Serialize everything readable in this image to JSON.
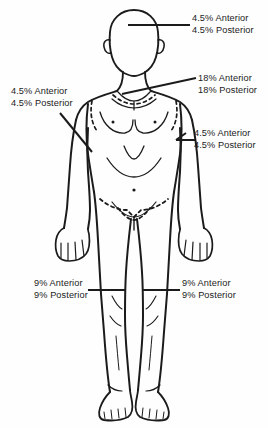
{
  "diagram": {
    "stroke_color": "#1b1b1b",
    "background_color": "#fefefe",
    "text_color": "#1b1b1b"
  },
  "callouts": [
    {
      "id": "head",
      "region": "head",
      "anterior": "4.5% Anterior",
      "posterior": "4.5% Posterior",
      "side": "right"
    },
    {
      "id": "trunk",
      "region": "trunk",
      "anterior": "18% Anterior",
      "posterior": "18% Posterior",
      "side": "right"
    },
    {
      "id": "arm-right",
      "region": "arm",
      "anterior": "4.5% Anterior",
      "posterior": "4.5% Posterior",
      "side": "right"
    },
    {
      "id": "arm-left",
      "region": "arm",
      "anterior": "4.5% Anterior",
      "posterior": "4.5% Posterior",
      "side": "left"
    },
    {
      "id": "leg-left",
      "region": "leg",
      "anterior": "9% Anterior",
      "posterior": "9% Posterior",
      "side": "left"
    },
    {
      "id": "leg-right",
      "region": "leg",
      "anterior": "9% Anterior",
      "posterior": "9% Posterior",
      "side": "right"
    }
  ]
}
